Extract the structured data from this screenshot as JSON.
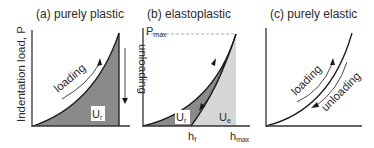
{
  "figure": {
    "ylabel": "Indentation load, P",
    "panels": [
      {
        "id": "a",
        "title": "(a) purely plastic",
        "labels": {
          "loading": "loading",
          "unloading": "unloading",
          "area": "U",
          "area_sub": "r"
        }
      },
      {
        "id": "b",
        "title": "(b) elastoplastic",
        "labels": {
          "pmax": "P",
          "pmax_sub": "max",
          "ur": "U",
          "ur_sub": "r",
          "ue": "U",
          "ue_sub": "e",
          "hr": "h",
          "hr_sub": "f",
          "hmax": "h",
          "hmax_sub": "max"
        }
      },
      {
        "id": "c",
        "title": "(c) purely elastic",
        "labels": {
          "loading": "loading",
          "unloading": "unloading"
        }
      }
    ],
    "colors": {
      "dark_fill": "#8a8a8a",
      "light_fill": "#d6d6d6",
      "line": "#1a1a1a",
      "axis": "#333333"
    }
  }
}
